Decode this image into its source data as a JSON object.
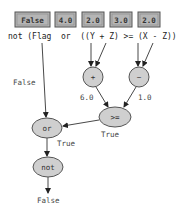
{
  "inputs": [
    {
      "name": "Flag",
      "value": "False"
    },
    {
      "name": "Y",
      "value": "4.0"
    },
    {
      "name": "Z",
      "value": "2.0"
    },
    {
      "name": "X",
      "value": "3.0"
    },
    {
      "name": "Z2",
      "value": "2.0"
    }
  ],
  "expression": {
    "text": "not (Flag  or  ((Y + Z) >= (X - Z)))"
  },
  "nodes": {
    "plus": "+",
    "minus": "−",
    "gte": ">=",
    "or": "or",
    "not": "not"
  },
  "edge_labels": {
    "flag_to_or": "False",
    "plus_to_gte": "6.0",
    "minus_to_gte": "1.0",
    "gte_to_or": "True",
    "or_to_not": "True",
    "not_result": "False"
  },
  "colors": {
    "box_fill": "#b5b5b5",
    "node_fill": "#cfcfcf",
    "stroke": "#555555"
  }
}
